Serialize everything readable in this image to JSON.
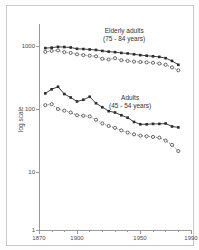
{
  "chart_data": {
    "type": "line",
    "title": "",
    "xlabel": "",
    "ylabel": "log scale",
    "xlim": [
      1870,
      1990
    ],
    "ylim": [
      1,
      3000
    ],
    "yscale": "log",
    "grid": false,
    "legend_position": "inline-annotations",
    "ytick_labels": [
      "1000",
      "100",
      "10",
      "1"
    ],
    "ytick_values": [
      1000,
      100,
      10,
      1
    ],
    "xtick_labels": [
      "1870",
      "1900",
      "1950",
      "1990"
    ],
    "xtick_values": [
      1870,
      1900,
      1950,
      1990
    ],
    "series": [
      {
        "name": "Elderly adults (75-84 years)",
        "marker": "filled-square",
        "line": "solid",
        "x": [
          1875,
          1880,
          1885,
          1890,
          1895,
          1900,
          1905,
          1910,
          1915,
          1920,
          1925,
          1930,
          1935,
          1940,
          1945,
          1950,
          1955,
          1960,
          1965,
          1970,
          1975,
          1980
        ],
        "values": [
          1180,
          1200,
          1240,
          1230,
          1210,
          1150,
          1140,
          1120,
          1100,
          1060,
          1030,
          1010,
          980,
          960,
          930,
          900,
          880,
          860,
          840,
          800,
          720,
          620
        ]
      },
      {
        "name": "Elderly adults (75-84 years) open",
        "marker": "open-circle",
        "line": "dotted",
        "x": [
          1875,
          1880,
          1885,
          1890,
          1895,
          1900,
          1905,
          1910,
          1915,
          1920,
          1925,
          1930,
          1935,
          1940,
          1945,
          1950,
          1955,
          1960,
          1965,
          1970,
          1975,
          1980
        ],
        "values": [
          1020,
          1060,
          1080,
          1010,
          980,
          930,
          900,
          880,
          860,
          780,
          760,
          800,
          740,
          720,
          700,
          690,
          680,
          670,
          650,
          620,
          560,
          500
        ]
      },
      {
        "name": "Adults (45-54 years)",
        "marker": "filled-square",
        "line": "solid",
        "x": [
          1875,
          1880,
          1885,
          1890,
          1895,
          1900,
          1905,
          1910,
          1915,
          1920,
          1925,
          1930,
          1935,
          1940,
          1945,
          1950,
          1955,
          1960,
          1965,
          1970,
          1975,
          1980
        ],
        "values": [
          205,
          240,
          265,
          200,
          175,
          150,
          160,
          180,
          140,
          120,
          103,
          98,
          88,
          80,
          68,
          62,
          62,
          63,
          63,
          64,
          57,
          55
        ]
      },
      {
        "name": "Adults (45-54 years) open",
        "marker": "open-circle",
        "line": "dotted",
        "x": [
          1875,
          1880,
          1885,
          1890,
          1895,
          1900,
          1905,
          1910,
          1915,
          1920,
          1925,
          1930,
          1935,
          1940,
          1945,
          1950,
          1955,
          1960,
          1965,
          1970,
          1975,
          1980
        ],
        "values": [
          130,
          135,
          112,
          105,
          98,
          88,
          86,
          84,
          74,
          64,
          58,
          54,
          49,
          45,
          42,
          40,
          39,
          38,
          37,
          33,
          28,
          22
        ]
      }
    ],
    "annotations": [
      {
        "id": "elderly",
        "line1": "Elderly adults",
        "line2": "(75 - 84 years)"
      },
      {
        "id": "adults",
        "line1": "Adults",
        "line2": "(45 - 54 years)"
      }
    ]
  },
  "colors": {
    "ink": "#2b2b2b",
    "axis": "#9a9a9a",
    "frame": "#c9c9c9",
    "background": "#ffffff"
  }
}
